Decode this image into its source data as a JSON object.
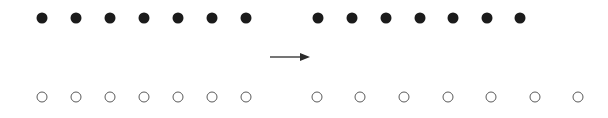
{
  "figure": {
    "width": 608,
    "height": 118,
    "background": "#ffffff"
  },
  "style": {
    "filled_color": "#1b1b1b",
    "open_stroke_color": "#5a5a5a",
    "open_stroke_width": 1.4,
    "arrow_color": "#2b2b2b",
    "marker_diameter": 11
  },
  "chart_data": {
    "type": "scatter",
    "title": "",
    "subtitle": "",
    "xlabel": "",
    "ylabel": "",
    "grid": false,
    "legend": "none",
    "xlim": [
      0,
      608
    ],
    "ylim": [
      0,
      118
    ],
    "annotations": [
      {
        "name": "rightward-arrow",
        "kind": "arrow",
        "label": "",
        "x_start": 270,
        "x_end": 311,
        "y": 57,
        "direction": "right",
        "color": "#2b2b2b"
      }
    ],
    "series": [
      {
        "name": "top-row-left-group",
        "marker": "filled-circle",
        "color": "#1b1b1b",
        "count": 7,
        "y": 18,
        "x": [
          42,
          76,
          110,
          144,
          178,
          212,
          246
        ]
      },
      {
        "name": "top-row-right-group",
        "marker": "filled-circle",
        "color": "#1b1b1b",
        "count": 7,
        "y": 18,
        "x": [
          318,
          352,
          386,
          420,
          453,
          487,
          520
        ]
      },
      {
        "name": "bottom-row-left-group",
        "marker": "open-circle",
        "color": "#5a5a5a",
        "count": 7,
        "y": 97,
        "x": [
          42,
          76,
          110,
          144,
          178,
          212,
          246
        ]
      },
      {
        "name": "bottom-row-right-group",
        "marker": "open-circle",
        "color": "#5a5a5a",
        "count": 7,
        "y": 97,
        "x": [
          317,
          360,
          404,
          448,
          491,
          535,
          578
        ]
      }
    ]
  }
}
